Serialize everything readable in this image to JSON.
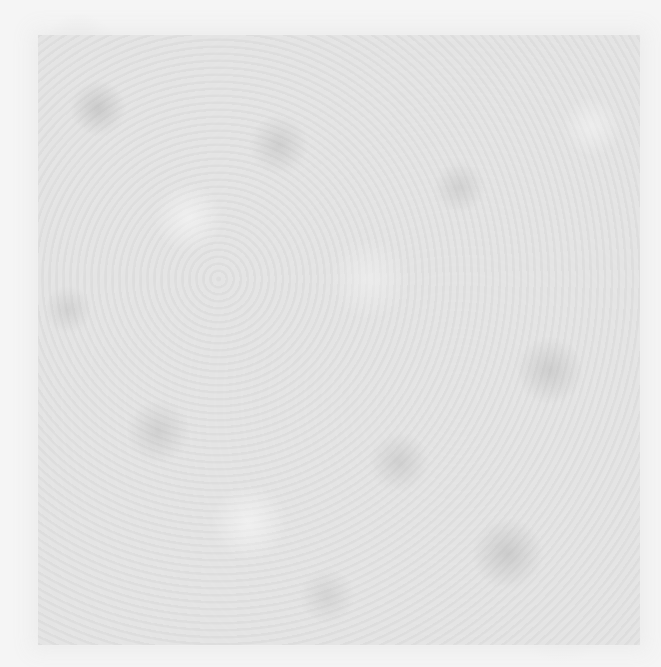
{
  "image": {
    "description": "Gray mottled noise texture with a slightly darker central square region and lighter border",
    "colors": {
      "border": "#f5f5f5",
      "square": "#e4e4e4",
      "speckle_dark": "#aaaaaa"
    }
  }
}
